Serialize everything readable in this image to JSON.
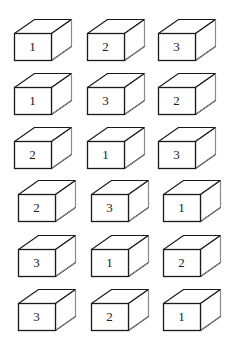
{
  "diagram": {
    "rows": [
      {
        "y": 19,
        "boxes": [
          {
            "x": 14,
            "label": "1"
          },
          {
            "x": 87,
            "label": "2"
          },
          {
            "x": 158,
            "label": "3"
          }
        ]
      },
      {
        "y": 73,
        "boxes": [
          {
            "x": 14,
            "label": "1"
          },
          {
            "x": 87,
            "label": "3"
          },
          {
            "x": 158,
            "label": "2"
          }
        ]
      },
      {
        "y": 127,
        "boxes": [
          {
            "x": 14,
            "label": "2"
          },
          {
            "x": 87,
            "label": "1"
          },
          {
            "x": 158,
            "label": "3"
          }
        ]
      },
      {
        "y": 180,
        "boxes": [
          {
            "x": 18,
            "label": "2"
          },
          {
            "x": 91,
            "label": "3"
          },
          {
            "x": 163,
            "label": "1"
          }
        ]
      },
      {
        "y": 235,
        "boxes": [
          {
            "x": 18,
            "label": "3"
          },
          {
            "x": 91,
            "label": "1"
          },
          {
            "x": 163,
            "label": "2"
          }
        ]
      },
      {
        "y": 289,
        "boxes": [
          {
            "x": 18,
            "label": "3"
          },
          {
            "x": 91,
            "label": "2"
          },
          {
            "x": 163,
            "label": "1"
          }
        ]
      }
    ],
    "colors": {
      "front_edge": "#1a1a1a",
      "back_edge": "#8a8a8a",
      "background": "#ffffff"
    }
  }
}
